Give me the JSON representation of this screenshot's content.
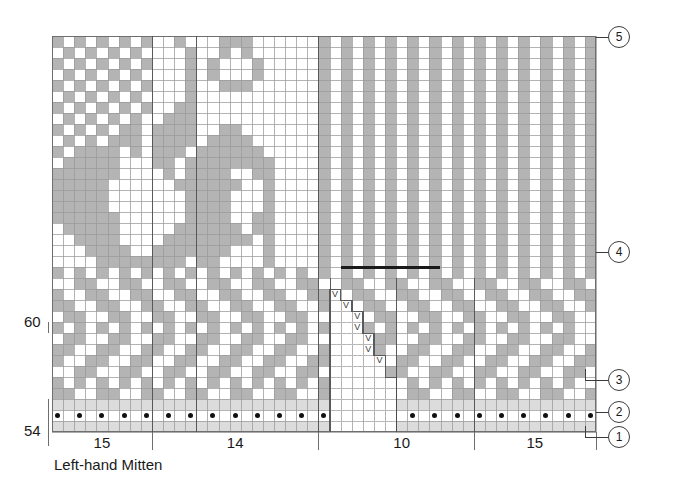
{
  "chart": {
    "title": "Left-hand Mitten",
    "type": "knitting-colorwork-chart",
    "row_labels": [
      {
        "text": "60",
        "row": 60
      },
      {
        "text": "54",
        "row": 54
      }
    ],
    "column_group_labels": [
      "15",
      "14",
      "10",
      "15"
    ],
    "callouts": [
      {
        "label": "1",
        "meaning": "cast-on / first round"
      },
      {
        "label": "2",
        "meaning": "purl round"
      },
      {
        "label": "3",
        "meaning": "cuff pattern band"
      },
      {
        "label": "4",
        "meaning": "thumb placement line"
      },
      {
        "label": "5",
        "meaning": "top of chart"
      }
    ],
    "legend_symbols": [
      {
        "name": "purl-dot",
        "glyph": "●",
        "meaning": "purl stitch"
      },
      {
        "name": "increase-v",
        "glyph": "V",
        "meaning": "increase (make one)"
      },
      {
        "name": "shaded-cell",
        "color": "#b4b4b4",
        "meaning": "contrast colour"
      },
      {
        "name": "empty-cell",
        "color": "#ffffff",
        "meaning": "main colour"
      }
    ],
    "colors": {
      "main": "#ffffff",
      "contrast": "#b4b4b4",
      "pale": "#dcdcdc",
      "grid": "#9a9a9a",
      "ink": "#1a1a1a",
      "marker_line": "#1a1a1a"
    },
    "geometry": {
      "cols": 49,
      "rows": 36,
      "cell_w": 11.1,
      "cell_h": 11.0,
      "origin_x": 52,
      "origin_y": 36
    }
  }
}
